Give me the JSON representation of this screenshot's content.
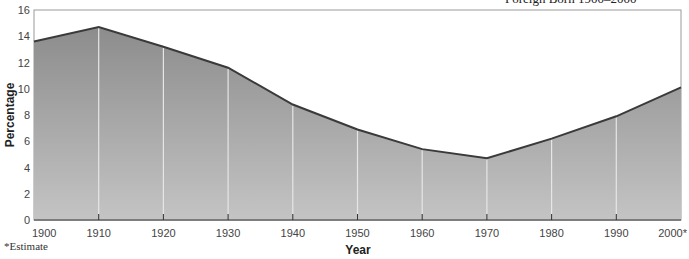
{
  "chart_data": {
    "type": "area",
    "title": "Foreign Born 1900–2000",
    "xlabel": "Year",
    "ylabel": "Percentage",
    "x": [
      "1900",
      "1910",
      "1920",
      "1930",
      "1940",
      "1950",
      "1960",
      "1970",
      "1980",
      "1990",
      "2000*"
    ],
    "values": [
      13.6,
      14.7,
      13.2,
      11.6,
      8.8,
      6.9,
      5.4,
      4.7,
      6.2,
      7.9,
      10.1
    ],
    "yticks": [
      0,
      2,
      4,
      6,
      8,
      10,
      12,
      14,
      16
    ],
    "ylim": [
      0,
      16
    ],
    "grid": false,
    "legend": null,
    "annotation": "*Estimate"
  },
  "colors": {
    "fill_top": "#8c8c8c",
    "fill_bottom": "#c4c4c4",
    "line": "#3a3a3a",
    "divider": "#e6e6e6"
  }
}
